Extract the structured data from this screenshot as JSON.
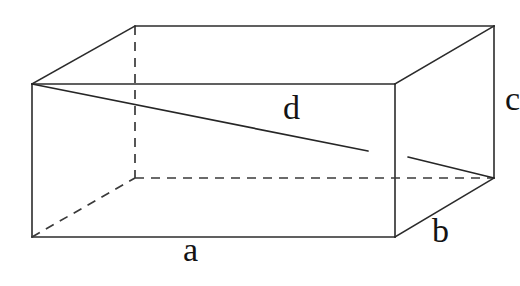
{
  "figure": {
    "shape": "rectangular-prism",
    "projection": "oblique",
    "background_color": "#ffffff",
    "stroke_color": "#2b2b2b",
    "label_color": "#141414"
  },
  "labels": {
    "a": "a",
    "b": "b",
    "c": "c",
    "d": "d"
  },
  "label_meaning": {
    "a": "length of front bottom edge",
    "b": "depth of receding edge",
    "c": "height of vertical edge",
    "d": "space diagonal of the box"
  },
  "geometry": {
    "front_face": {
      "top_left": [
        32,
        84
      ],
      "top_right": [
        395,
        84
      ],
      "bottom_right": [
        395,
        237
      ],
      "bottom_left": [
        32,
        237
      ]
    },
    "back_face": {
      "top_left": [
        135,
        26
      ],
      "top_right": [
        494,
        26
      ],
      "bottom_right": [
        494,
        178
      ],
      "bottom_left": [
        135,
        178
      ]
    },
    "hidden_edges": [
      [
        [
          135,
          26
        ],
        [
          135,
          178
        ]
      ],
      [
        [
          135,
          178
        ],
        [
          494,
          178
        ]
      ],
      [
        [
          32,
          237
        ],
        [
          135,
          178
        ]
      ]
    ],
    "diagonal": {
      "from": [
        32,
        84
      ],
      "to": [
        494,
        178
      ],
      "visible_segment_1": [
        [
          32,
          84
        ],
        [
          368,
          151
        ]
      ],
      "visible_segment_2": [
        [
          408,
          157
        ],
        [
          494,
          178
        ]
      ]
    }
  }
}
